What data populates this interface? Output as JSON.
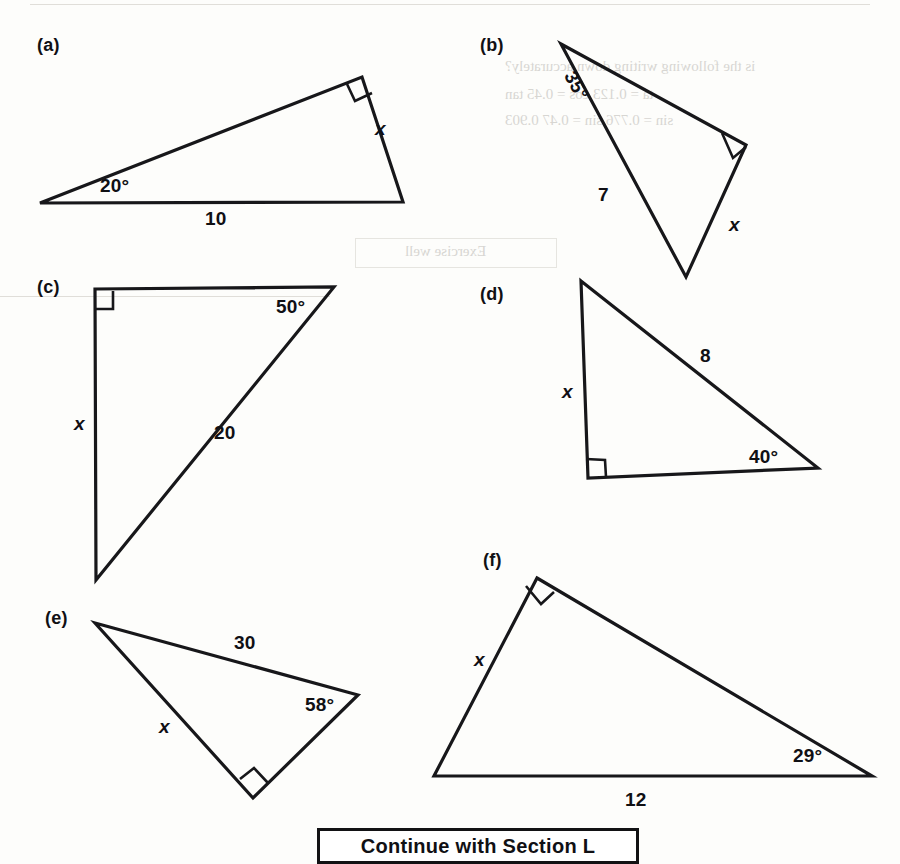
{
  "page": {
    "width": 900,
    "height": 864,
    "background_color": "#fdfdfb",
    "ink_color": "#17171a"
  },
  "figures": [
    {
      "id": "a",
      "part_label": "(a)",
      "part_label_pos": [
        37,
        36
      ],
      "shape": "right-triangle",
      "vertices": [
        [
          40,
          203
        ],
        [
          362,
          77
        ],
        [
          403,
          202
        ]
      ],
      "right_angle_at_vertex_index": 1,
      "labels": [
        {
          "name": "angle-label-20",
          "text": "20°",
          "pos": [
            100,
            176
          ],
          "kind": "angle"
        },
        {
          "name": "side-label-10",
          "text": "10",
          "pos": [
            205,
            209
          ],
          "kind": "length"
        },
        {
          "name": "unknown-label-x",
          "text": "x",
          "pos": [
            375,
            119
          ],
          "kind": "unknown"
        }
      ]
    },
    {
      "id": "b",
      "part_label": "(b)",
      "part_label_pos": [
        480,
        36
      ],
      "shape": "right-triangle",
      "vertices": [
        [
          561,
          44
        ],
        [
          746,
          145
        ],
        [
          686,
          277
        ]
      ],
      "right_angle_at_vertex_index": 1,
      "labels": [
        {
          "name": "angle-label-35",
          "text": "35°",
          "pos": [
            578,
            68
          ],
          "kind": "angle"
        },
        {
          "name": "side-label-7",
          "text": "7",
          "pos": [
            598,
            185
          ],
          "kind": "length"
        },
        {
          "name": "unknown-label-x",
          "text": "x",
          "pos": [
            729,
            215
          ],
          "kind": "unknown"
        }
      ]
    },
    {
      "id": "c",
      "part_label": "(c)",
      "part_label_pos": [
        37,
        278
      ],
      "shape": "right-triangle",
      "vertices": [
        [
          95,
          289
        ],
        [
          334,
          287
        ],
        [
          96,
          580
        ]
      ],
      "right_angle_at_vertex_index": 0,
      "labels": [
        {
          "name": "angle-label-50",
          "text": "50°",
          "pos": [
            276,
            297
          ],
          "kind": "angle"
        },
        {
          "name": "side-label-20",
          "text": "20",
          "pos": [
            214,
            423
          ],
          "kind": "length"
        },
        {
          "name": "unknown-label-x",
          "text": "x",
          "pos": [
            74,
            414
          ],
          "kind": "unknown"
        }
      ]
    },
    {
      "id": "d",
      "part_label": "(d)",
      "part_label_pos": [
        480,
        285
      ],
      "shape": "right-triangle",
      "vertices": [
        [
          581,
          281
        ],
        [
          818,
          468
        ],
        [
          588,
          478
        ]
      ],
      "right_angle_at_vertex_index": 2,
      "labels": [
        {
          "name": "side-label-8",
          "text": "8",
          "pos": [
            700,
            346
          ],
          "kind": "length"
        },
        {
          "name": "angle-label-40",
          "text": "40°",
          "pos": [
            749,
            447
          ],
          "kind": "angle"
        },
        {
          "name": "unknown-label-x",
          "text": "x",
          "pos": [
            562,
            382
          ],
          "kind": "unknown"
        }
      ]
    },
    {
      "id": "e",
      "part_label": "(e)",
      "part_label_pos": [
        45,
        609
      ],
      "shape": "right-triangle",
      "vertices": [
        [
          95,
          623
        ],
        [
          358,
          695
        ],
        [
          253,
          798
        ]
      ],
      "right_angle_at_vertex_index": 2,
      "labels": [
        {
          "name": "side-label-30",
          "text": "30",
          "pos": [
            234,
            633
          ],
          "kind": "length"
        },
        {
          "name": "angle-label-58",
          "text": "58°",
          "pos": [
            305,
            695
          ],
          "kind": "angle"
        },
        {
          "name": "unknown-label-x",
          "text": "x",
          "pos": [
            159,
            717
          ],
          "kind": "unknown"
        }
      ]
    },
    {
      "id": "f",
      "part_label": "(f)",
      "part_label_pos": [
        483,
        551
      ],
      "shape": "right-triangle",
      "vertices": [
        [
          537,
          578
        ],
        [
          872,
          776
        ],
        [
          434,
          776
        ]
      ],
      "right_angle_at_vertex_index": 0,
      "labels": [
        {
          "name": "unknown-label-x",
          "text": "x",
          "pos": [
            474,
            650
          ],
          "kind": "unknown"
        },
        {
          "name": "angle-label-29",
          "text": "29°",
          "pos": [
            793,
            746
          ],
          "kind": "angle"
        },
        {
          "name": "side-label-12",
          "text": "12",
          "pos": [
            625,
            790
          ],
          "kind": "length"
        }
      ]
    }
  ],
  "footer": {
    "continue_label": "Continue with Section L"
  },
  "ghost_marks": {
    "note": "faint reverse-side show-through, illegible",
    "lines": [
      {
        "text": "— — — — — — — — — — —",
        "pos": [
          40,
          2
        ]
      },
      {
        "text": "is the following writing down accurately?",
        "pos": [
          505,
          58
        ]
      },
      {
        "text": "ta = 0.123        cos = 0.45        tan",
        "pos": [
          505,
          86
        ]
      },
      {
        "text": "sin  = 0.776        sin = 0.47        0.903",
        "pos": [
          505,
          112
        ]
      },
      {
        "text": "Exercise well",
        "pos": [
          520,
          245
        ]
      }
    ]
  }
}
